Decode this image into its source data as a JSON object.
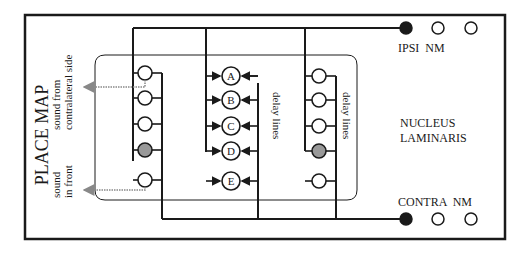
{
  "figure": {
    "title": "PLACE MAP",
    "place_map_labels": {
      "contralateral": [
        "sound from",
        "contralateral side"
      ],
      "front": [
        "sound",
        "in front"
      ]
    },
    "delay_lines_label_1": "delay lines",
    "delay_lines_label_2": "delay lines",
    "nucleus_label": [
      "NUCLEUS",
      "LAMINARIS"
    ],
    "ipsi_label": "IPSI  NM",
    "contra_label": "CONTRA  NM",
    "coincidence_detectors": [
      "A",
      "B",
      "C",
      "D",
      "E"
    ],
    "colors": {
      "line": "#1a1a1a",
      "active_neuron": "#999999",
      "output_arrow": "#888888"
    }
  }
}
